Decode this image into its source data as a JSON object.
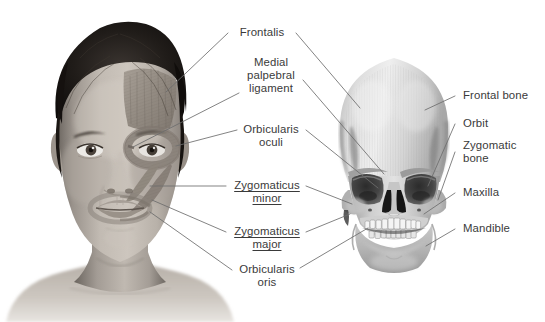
{
  "figure": {
    "background_color": "#ffffff",
    "text_color": "#3a3a3a",
    "leader_line_color": "#6d6d6d"
  },
  "images": {
    "face_photo": {
      "name": "frontal photograph of a young person with facial muscle overlay on the subject's left side",
      "alt": "Face with frontalis, orbicularis oculi, zygomaticus minor, zygomaticus major and orbicularis oris muscles rendered on the skin"
    },
    "skull_image": {
      "name": "frontal view of a human skull",
      "alt": "Anterior skull showing frontal bone, orbits, zygomatic bones, maxilla and mandible"
    }
  },
  "labels": {
    "muscles": [
      {
        "id": "frontalis",
        "lines": [
          "Frontalis"
        ],
        "underline": false,
        "align": "center"
      },
      {
        "id": "medial-palpebral-ligament",
        "lines": [
          "Medial",
          "palpebral",
          "ligament"
        ],
        "underline": false,
        "align": "center"
      },
      {
        "id": "orbicularis-oculi",
        "lines": [
          "Orbicularis",
          "oculi"
        ],
        "underline": false,
        "align": "center"
      },
      {
        "id": "zygomaticus-minor",
        "lines": [
          "Zygomaticus",
          "minor"
        ],
        "underline": true,
        "align": "center"
      },
      {
        "id": "zygomaticus-major",
        "lines": [
          "Zygomaticus",
          "major"
        ],
        "underline": true,
        "align": "center"
      },
      {
        "id": "orbicularis-oris",
        "lines": [
          "Orbicularis",
          "oris"
        ],
        "underline": false,
        "align": "center"
      }
    ],
    "bones": [
      {
        "id": "frontal-bone",
        "lines": [
          "Frontal bone"
        ],
        "underline": false,
        "align": "left"
      },
      {
        "id": "orbit",
        "lines": [
          "Orbit"
        ],
        "underline": false,
        "align": "left"
      },
      {
        "id": "zygomatic-bone",
        "lines": [
          "Zygomatic",
          "bone"
        ],
        "underline": false,
        "align": "left"
      },
      {
        "id": "maxilla",
        "lines": [
          "Maxilla"
        ],
        "underline": false,
        "align": "left"
      },
      {
        "id": "mandible",
        "lines": [
          "Mandible"
        ],
        "underline": false,
        "align": "left"
      }
    ]
  }
}
